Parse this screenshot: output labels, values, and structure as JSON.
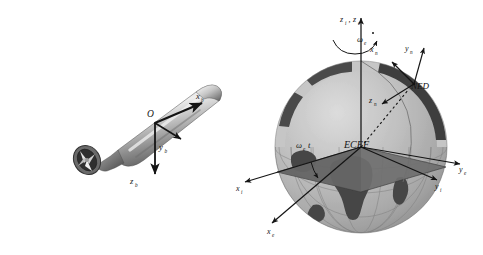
{
  "figure": {
    "background_color": "#ffffff",
    "ink_color": "#141414"
  },
  "body_frame_panel": {
    "name": "underwater-vehicle-body-frame",
    "vehicle": {
      "name": "torpedo-shaped underwater vehicle",
      "hull_color_light": "#e9e9e9",
      "hull_color_mid": "#9a9a9a",
      "hull_color_dark": "#5d5d5d",
      "propeller_label": "ducted propeller"
    },
    "origin_label": "O",
    "axes": [
      {
        "id": "x_b",
        "base": "x",
        "sub": "b",
        "direction": "forward-right (surge)"
      },
      {
        "id": "y_b",
        "base": "y",
        "sub": "b",
        "direction": "starboard (sway)"
      },
      {
        "id": "z_b",
        "base": "z",
        "sub": "b",
        "direction": "down (heave)"
      }
    ]
  },
  "earth_frame_panel": {
    "name": "earth-reference-frames",
    "sphere": {
      "ocean_color": "#b9b9b9",
      "land_color": "#4b4b4b",
      "graticule_color": "#7a7a7a",
      "equatorial_plane_color": "#6f6f6f",
      "upper_band_color": "#3f3f3f"
    },
    "center_label": "ECEF",
    "ned_label": "NED",
    "rotation_rate_label": {
      "base": "ω",
      "sub": "e"
    },
    "rotation_angle_label": {
      "base": "ω",
      "sub": "e",
      "suffix": "t"
    },
    "polar_axis_label": {
      "parts": [
        {
          "base": "z",
          "sub": "i"
        },
        {
          "base": "z",
          "sub": "e"
        }
      ],
      "text": "z_i , z_e"
    },
    "axes": [
      {
        "id": "z_i_z_e",
        "base": "z",
        "sub": "i , z e",
        "direction": "polar / north"
      },
      {
        "id": "x_i",
        "base": "x",
        "sub": "i",
        "direction": "inertial, toward lower-left"
      },
      {
        "id": "y_i",
        "base": "y",
        "sub": "i",
        "direction": "inertial, toward lower-right"
      },
      {
        "id": "x_e",
        "base": "x",
        "sub": "e",
        "direction": "earth-fixed, toward bottom-left"
      },
      {
        "id": "y_e",
        "base": "y",
        "sub": "e",
        "direction": "earth-fixed, toward right"
      },
      {
        "id": "x_n",
        "base": "x",
        "sub": "n",
        "direction": "north (local tangent)"
      },
      {
        "id": "y_n",
        "base": "y",
        "sub": "n",
        "direction": "east (local tangent)"
      },
      {
        "id": "z_n",
        "base": "z",
        "sub": "n",
        "direction": "down (toward earth center)"
      }
    ]
  }
}
